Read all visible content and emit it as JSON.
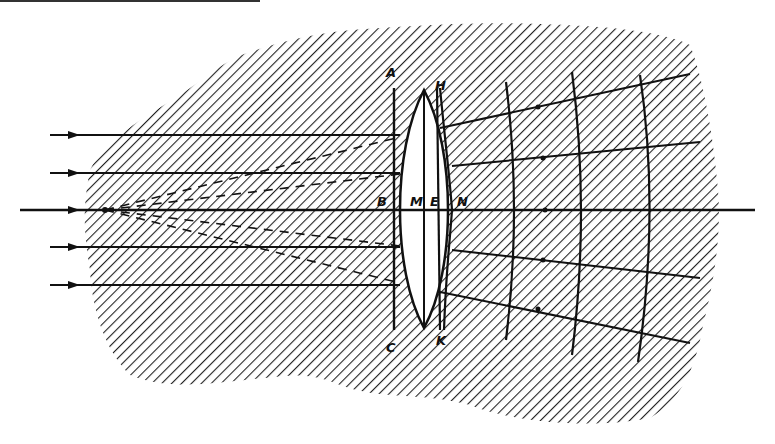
{
  "diagram": {
    "type": "optics-ray-diagram",
    "colors": {
      "ink": "#111111",
      "background": "#ffffff",
      "hatch": "#222222"
    },
    "labels": {
      "A": "A",
      "H": "H",
      "B": "B",
      "M": "M",
      "E": "E",
      "N": "N",
      "C": "C",
      "K": "K"
    },
    "elements": {
      "incoming_rays": 5,
      "wavefronts": 3,
      "dashed_construction_lines": 4,
      "lens": "biconvex",
      "reference_lines": [
        "AC",
        "HK"
      ]
    }
  }
}
